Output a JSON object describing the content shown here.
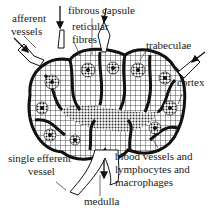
{
  "diagram": {
    "labels": {
      "afferent": "afferent",
      "vessels": "vessels",
      "fibrous_capsule": "fibrous capsule",
      "reticular": "reticular",
      "fibres": "fibres",
      "trabeculae": "trabeculae",
      "cortex": "cortex",
      "single_efferent": "single efferent",
      "vessel": "vessel",
      "blood_line1": "blood vessels and",
      "blood_line2": "lymphocytes and",
      "blood_line3": "macrophages",
      "medulla": "medulla"
    },
    "colors": {
      "ink": "#1a1a1a",
      "background": "#ffffff"
    }
  }
}
